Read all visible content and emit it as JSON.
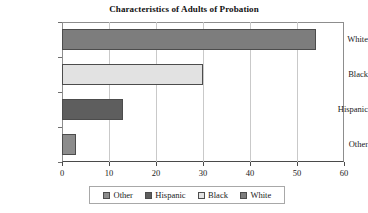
{
  "chart_data": {
    "type": "bar",
    "orientation": "horizontal",
    "title": "Characteristics of Adults of Probation",
    "xlabel": "",
    "ylabel": "",
    "categories": [
      "White",
      "Black",
      "Hispanic",
      "Other"
    ],
    "values": [
      54,
      30,
      13,
      3
    ],
    "xlim": [
      0,
      60
    ],
    "xticks": [
      "0",
      "10",
      "20",
      "30",
      "40",
      "50",
      "60"
    ],
    "xtick_values": [
      0,
      10,
      20,
      30,
      40,
      50,
      60
    ],
    "grid": "vertical",
    "legend_position": "bottom",
    "legend": [
      {
        "label": "Other",
        "color": "#8c8c8c"
      },
      {
        "label": "Hispanic",
        "color": "#5e5e5e"
      },
      {
        "label": "Black",
        "color": "#e2e2e2"
      },
      {
        "label": "White",
        "color": "#7d7d7d"
      }
    ],
    "bars": [
      {
        "category": "White",
        "value": 54,
        "color": "#7d7d7d"
      },
      {
        "category": "Black",
        "value": 30,
        "color": "#e2e2e2"
      },
      {
        "category": "Hispanic",
        "value": 13,
        "color": "#5e5e5e"
      },
      {
        "category": "Other",
        "value": 3,
        "color": "#8c8c8c"
      }
    ],
    "colors": {
      "axis": "#4a4a4a",
      "grid": "#c9c9c9",
      "bar_outline": "#4c4c4c",
      "background": "#ffffff"
    }
  }
}
